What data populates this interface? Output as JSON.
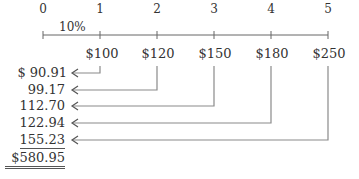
{
  "timeline": {
    "periods": [
      "0",
      "1",
      "2",
      "3",
      "4",
      "5"
    ],
    "rate_label": "10%",
    "cash_flows": [
      "$100",
      "$120",
      "$150",
      "$180",
      "$250"
    ]
  },
  "present_values": {
    "rows": [
      "$ 90.91",
      "99.17",
      "112.70",
      "122.94",
      "155.23"
    ],
    "total": "$580.95"
  },
  "colors": {
    "text": "#333333",
    "lines": "#8a8a8a"
  }
}
